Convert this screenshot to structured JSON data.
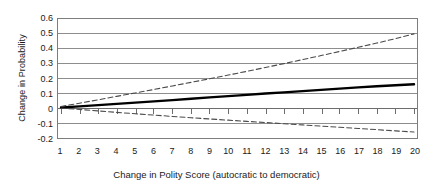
{
  "chart_data": {
    "type": "line",
    "title": "",
    "xlabel": "Change in Polity Score (autocratic to democratic)",
    "ylabel": "Change in Probability",
    "xlim": [
      1,
      20
    ],
    "ylim": [
      -0.2,
      0.6
    ],
    "grid": true,
    "grid_axis": "y",
    "legend": "none",
    "x": [
      1,
      2,
      3,
      4,
      5,
      6,
      7,
      8,
      9,
      10,
      11,
      12,
      13,
      14,
      15,
      16,
      17,
      18,
      19,
      20
    ],
    "xticks": [
      "1",
      "2",
      "3",
      "4",
      "5",
      "6",
      "7",
      "8",
      "9",
      "10",
      "11",
      "12",
      "13",
      "14",
      "15",
      "16",
      "17",
      "18",
      "19",
      "20"
    ],
    "yticks": [
      "-0.2",
      "-0.1",
      "0",
      "0.1",
      "0.2",
      "0.3",
      "0.4",
      "0.5",
      "0.6"
    ],
    "ytick_values": [
      -0.2,
      -0.1,
      0,
      0.1,
      0.2,
      0.3,
      0.4,
      0.5,
      0.6
    ],
    "zero_line": 0,
    "series": [
      {
        "name": "Point estimate",
        "style": "solid",
        "color": "#000000",
        "width": 2.4,
        "values": [
          0.005,
          0.013,
          0.021,
          0.029,
          0.038,
          0.046,
          0.055,
          0.064,
          0.073,
          0.082,
          0.09,
          0.099,
          0.107,
          0.115,
          0.124,
          0.132,
          0.14,
          0.148,
          0.155,
          0.161
        ]
      },
      {
        "name": "Upper confidence bound",
        "style": "dashed",
        "color": "#4a4a4a",
        "width": 1.1,
        "values": [
          0.012,
          0.034,
          0.057,
          0.08,
          0.103,
          0.126,
          0.15,
          0.174,
          0.198,
          0.223,
          0.248,
          0.274,
          0.3,
          0.327,
          0.354,
          0.382,
          0.41,
          0.438,
          0.468,
          0.5
        ]
      },
      {
        "name": "Lower confidence bound",
        "style": "dashed",
        "color": "#4a4a4a",
        "width": 1.1,
        "values": [
          0.0,
          -0.008,
          -0.018,
          -0.028,
          -0.037,
          -0.046,
          -0.055,
          -0.064,
          -0.072,
          -0.08,
          -0.088,
          -0.096,
          -0.104,
          -0.112,
          -0.12,
          -0.128,
          -0.136,
          -0.144,
          -0.152,
          -0.16
        ]
      }
    ]
  },
  "axes": {
    "y_title": "Change in Probability",
    "x_title": "Change in Polity Score (autocratic to democratic)"
  }
}
